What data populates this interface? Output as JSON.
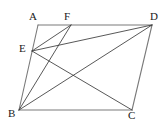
{
  "figure": {
    "kind": "plane-geometry-diagram",
    "background_color": "#ffffff",
    "stroke_color": "#3a3a3a",
    "side_stroke_color": "#7a7a7a",
    "label_color": "#1a1a1a",
    "viewbox": {
      "width": 167,
      "height": 126
    },
    "vertices": [
      {
        "id": "A",
        "label": "A",
        "x": 38,
        "y": 25,
        "label_x": 29,
        "label_y": 11
      },
      {
        "id": "F",
        "label": "F",
        "x": 71,
        "y": 25,
        "label_x": 64,
        "label_y": 11
      },
      {
        "id": "D",
        "label": "D",
        "x": 152,
        "y": 25,
        "label_x": 150,
        "label_y": 11
      },
      {
        "id": "E",
        "label": "E",
        "x": 32,
        "y": 51,
        "label_x": 19,
        "label_y": 43
      },
      {
        "id": "B",
        "label": "B",
        "x": 19,
        "y": 110,
        "label_x": 8,
        "label_y": 108
      },
      {
        "id": "C",
        "label": "C",
        "x": 132,
        "y": 110,
        "label_x": 128,
        "label_y": 110
      }
    ],
    "segments": [
      {
        "id": "AD",
        "from": "A",
        "to": "D",
        "role": "side",
        "x1": 38,
        "y1": 25,
        "x2": 152,
        "y2": 25
      },
      {
        "id": "AB",
        "from": "A",
        "to": "B",
        "role": "side",
        "x1": 38,
        "y1": 25,
        "x2": 19,
        "y2": 110
      },
      {
        "id": "BC",
        "from": "B",
        "to": "C",
        "role": "side",
        "x1": 19,
        "y1": 110,
        "x2": 132,
        "y2": 110
      },
      {
        "id": "DC",
        "from": "D",
        "to": "C",
        "role": "side",
        "x1": 152,
        "y1": 25,
        "x2": 132,
        "y2": 110
      },
      {
        "id": "EF",
        "from": "E",
        "to": "F",
        "role": "cevian",
        "x1": 32,
        "y1": 51,
        "x2": 71,
        "y2": 25
      },
      {
        "id": "ED",
        "from": "E",
        "to": "D",
        "role": "cevian",
        "x1": 32,
        "y1": 51,
        "x2": 152,
        "y2": 25
      },
      {
        "id": "EC",
        "from": "E",
        "to": "C",
        "role": "diagonal",
        "x1": 32,
        "y1": 51,
        "x2": 132,
        "y2": 110
      },
      {
        "id": "BF",
        "from": "B",
        "to": "F",
        "role": "cevian",
        "x1": 19,
        "y1": 110,
        "x2": 71,
        "y2": 25
      },
      {
        "id": "BD",
        "from": "B",
        "to": "D",
        "role": "diagonal",
        "x1": 19,
        "y1": 110,
        "x2": 152,
        "y2": 25
      }
    ]
  }
}
